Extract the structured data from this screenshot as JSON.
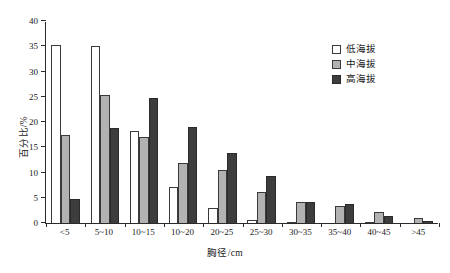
{
  "chart_data": {
    "type": "bar",
    "title": "",
    "xlabel": "胸径/cm",
    "ylabel": "百分比/%",
    "ylim": [
      0,
      40
    ],
    "yticks": [
      0,
      5,
      10,
      15,
      20,
      25,
      30,
      35,
      40
    ],
    "grid": false,
    "legend_position": "top-right",
    "categories": [
      "<5",
      "5~10",
      "10~15",
      "10~20",
      "20~25",
      "25~30",
      "30~35",
      "35~40",
      "40~45",
      ">45"
    ],
    "series": [
      {
        "name": "低海拔",
        "color": "#ffffff",
        "values": [
          35.3,
          35.0,
          18.2,
          7.1,
          3.0,
          0.6,
          0.3,
          0.0,
          0.3,
          0.0
        ]
      },
      {
        "name": "中海拔",
        "color": "#b2b2b2",
        "values": [
          17.5,
          25.4,
          17.1,
          11.9,
          10.5,
          6.1,
          4.2,
          3.3,
          2.2,
          0.9
        ]
      },
      {
        "name": "高海拔",
        "color": "#3d3d3d",
        "values": [
          4.7,
          18.8,
          24.7,
          19.0,
          13.8,
          9.3,
          4.2,
          3.7,
          1.3,
          0.4
        ]
      }
    ]
  },
  "legend": {
    "items": [
      {
        "label": "低海拔"
      },
      {
        "label": "中海拔"
      },
      {
        "label": "高海拔"
      }
    ]
  }
}
